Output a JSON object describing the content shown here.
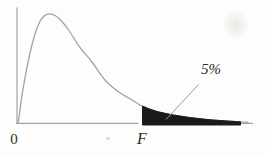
{
  "figure": {
    "origin_label": "0",
    "critical_value_label": "F",
    "tail_probability_label": "5%",
    "background_color": "#fdfdfc",
    "axis_color": "#a3a3a3",
    "curve_color": "#a3a3a3",
    "shade_color": "#1a1a1a",
    "leader_color": "#9a9a9a",
    "text_color": "#2e2c2a"
  },
  "chart_data": {
    "type": "area",
    "title": "",
    "xlabel": "",
    "ylabel": "",
    "x_tick_labels": [
      "0",
      "F"
    ],
    "y_tick_labels": [],
    "legend": "none",
    "grid": false,
    "annotations": [
      {
        "text": "5%",
        "target": "shaded upper-tail region beyond F"
      }
    ],
    "curve_points_px": [
      [
        18,
        123.5
      ],
      [
        19.5,
        114
      ],
      [
        22,
        95
      ],
      [
        25,
        78
      ],
      [
        28.5,
        60
      ],
      [
        33,
        41
      ],
      [
        38,
        25.5
      ],
      [
        43.5,
        16.5
      ],
      [
        49.5,
        13.8
      ],
      [
        55.5,
        15.8
      ],
      [
        61.5,
        21
      ],
      [
        69,
        30.5
      ],
      [
        80,
        47.5
      ],
      [
        92,
        62
      ],
      [
        105,
        80
      ],
      [
        118,
        91.5
      ],
      [
        130,
        98.8
      ],
      [
        140,
        105
      ],
      [
        148,
        108.5
      ],
      [
        158,
        111.8
      ],
      [
        172,
        114.8
      ],
      [
        190,
        117.6
      ],
      [
        210,
        119.8
      ],
      [
        230,
        121.2
      ],
      [
        248,
        122.3
      ]
    ],
    "axis_px": {
      "y_axis_x": 17,
      "y_axis_top": 7.5,
      "x_axis_y": 123.4,
      "x_axis_left": 16,
      "x_axis_gap": [
        138.5,
        142.5
      ],
      "x_axis_right": 253
    },
    "shade_px": {
      "start_x": 142.5,
      "end_x": 240.5,
      "baseline_y": 125
    },
    "leader_line_px": {
      "from": [
        198.5,
        84.5
      ],
      "to": [
        166,
        119.5
      ]
    }
  }
}
